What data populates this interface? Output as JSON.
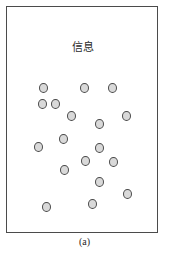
{
  "figure": {
    "caption": "(a)",
    "panel": {
      "title": "信息",
      "frame": {
        "x": 6,
        "y": 6,
        "width": 152,
        "height": 227,
        "border_color": "#4b4b4b",
        "background_color": "#ffffff"
      }
    }
  },
  "chart_data": {
    "type": "scatter",
    "title": "信息",
    "subtitle": "",
    "xlabel": "",
    "ylabel": "",
    "xlim": [
      0,
      152
    ],
    "ylim": [
      0,
      227
    ],
    "grid": false,
    "legend": null,
    "annotations": [
      "(a)"
    ],
    "marker": {
      "shape": "circle",
      "diameter_px": 9,
      "fill_color": "#d9d9d9",
      "edge_color": "#4a4a4a"
    },
    "point_count": 20,
    "series": [
      {
        "name": "信息",
        "points": [
          {
            "x": 32,
            "y": 76
          },
          {
            "x": 73,
            "y": 76
          },
          {
            "x": 101,
            "y": 76
          },
          {
            "x": 31,
            "y": 92
          },
          {
            "x": 44,
            "y": 92
          },
          {
            "x": 60,
            "y": 104
          },
          {
            "x": 115,
            "y": 104
          },
          {
            "x": 88,
            "y": 112
          },
          {
            "x": 52,
            "y": 127
          },
          {
            "x": 27,
            "y": 135
          },
          {
            "x": 88,
            "y": 136
          },
          {
            "x": 74,
            "y": 149
          },
          {
            "x": 102,
            "y": 150
          },
          {
            "x": 53,
            "y": 158
          },
          {
            "x": 88,
            "y": 170
          },
          {
            "x": 116,
            "y": 182
          },
          {
            "x": 81,
            "y": 192
          },
          {
            "x": 35,
            "y": 195
          }
        ]
      }
    ]
  },
  "nodes": [
    {
      "id": "n1",
      "x": 32,
      "y": 76
    },
    {
      "id": "n2",
      "x": 73,
      "y": 76
    },
    {
      "id": "n3",
      "x": 101,
      "y": 76
    },
    {
      "id": "n4",
      "x": 31,
      "y": 92
    },
    {
      "id": "n5",
      "x": 44,
      "y": 92
    },
    {
      "id": "n6",
      "x": 60,
      "y": 104
    },
    {
      "id": "n7",
      "x": 115,
      "y": 104
    },
    {
      "id": "n8",
      "x": 88,
      "y": 112
    },
    {
      "id": "n9",
      "x": 52,
      "y": 127
    },
    {
      "id": "n10",
      "x": 27,
      "y": 135
    },
    {
      "id": "n11",
      "x": 88,
      "y": 136
    },
    {
      "id": "n12",
      "x": 74,
      "y": 149
    },
    {
      "id": "n13",
      "x": 102,
      "y": 150
    },
    {
      "id": "n14",
      "x": 53,
      "y": 158
    },
    {
      "id": "n15",
      "x": 88,
      "y": 170
    },
    {
      "id": "n16",
      "x": 116,
      "y": 182
    },
    {
      "id": "n17",
      "x": 81,
      "y": 192
    },
    {
      "id": "n18",
      "x": 35,
      "y": 195
    }
  ]
}
